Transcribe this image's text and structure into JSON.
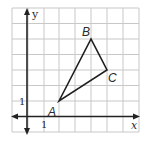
{
  "diagram": {
    "type": "coordinate-plane-triangle",
    "axes": {
      "x_label": "x",
      "y_label": "y",
      "x_tick_label": "1",
      "y_tick_label": "1"
    },
    "grid": {
      "columns": 8,
      "rows": 8,
      "x_range": [
        -1,
        7
      ],
      "y_range": [
        -1,
        7
      ],
      "line_color": "#c8c8c8",
      "axis_color": "#222222"
    },
    "triangle": {
      "stroke_color": "#1e1e1e",
      "vertices": [
        {
          "label": "A",
          "x": 2,
          "y": 1
        },
        {
          "label": "B",
          "x": 4,
          "y": 5
        },
        {
          "label": "C",
          "x": 5,
          "y": 3
        }
      ]
    }
  }
}
